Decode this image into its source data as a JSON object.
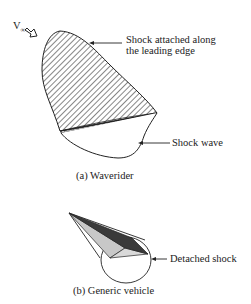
{
  "figure": {
    "panel_a": {
      "caption": "(a) Waverider",
      "freestream_label": "V",
      "freestream_subscript": "∞",
      "labels": {
        "shock_attached_line1": "Shock attached along",
        "shock_attached_line2": "the leading edge",
        "shock_wave": "Shock wave"
      }
    },
    "panel_b": {
      "caption": "(b) Generic vehicle",
      "labels": {
        "detached_shock": "Detached shock"
      }
    }
  }
}
